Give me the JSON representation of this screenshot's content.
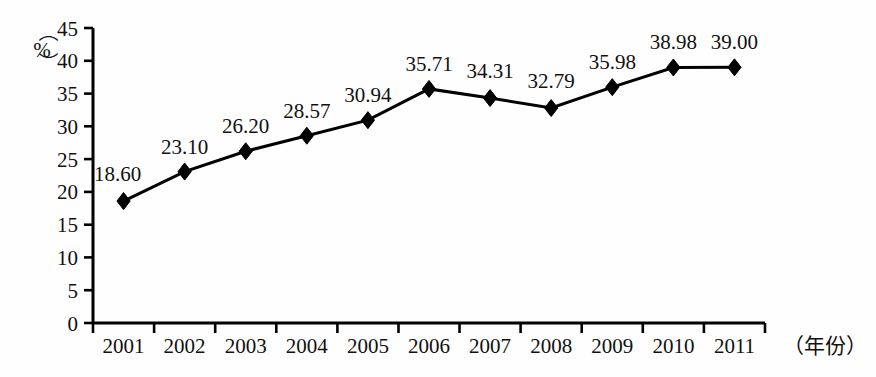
{
  "chart_data": {
    "type": "line",
    "title": "",
    "subtitle": "",
    "xlabel": "（年份）",
    "ylabel": "（%）",
    "ylabel_unit": "%",
    "categories": [
      "2001",
      "2002",
      "2003",
      "2004",
      "2005",
      "2006",
      "2007",
      "2008",
      "2009",
      "2010",
      "2011"
    ],
    "values": [
      18.6,
      23.1,
      26.2,
      28.57,
      30.94,
      35.71,
      34.31,
      32.79,
      35.98,
      38.98,
      39.0
    ],
    "data_labels": [
      "18.60",
      "23.10",
      "26.20",
      "28.57",
      "30.94",
      "35.71",
      "34.31",
      "32.79",
      "35.98",
      "38.98",
      "39.00"
    ],
    "ylim": [
      0,
      45
    ],
    "ytick_values": [
      0,
      5,
      10,
      15,
      20,
      25,
      30,
      35,
      40,
      45
    ],
    "ytick_labels": [
      "0",
      "5",
      "10",
      "15",
      "20",
      "25",
      "30",
      "35",
      "40",
      "45"
    ],
    "grid": false,
    "legend": null,
    "legend_position": "none",
    "marker": "diamond",
    "series_color": "#000000",
    "line_color": "#000000",
    "axis_color": "#000000",
    "background_color": "#ffffff",
    "series": [
      {
        "name": "",
        "values": [
          18.6,
          23.1,
          26.2,
          28.57,
          30.94,
          35.71,
          34.31,
          32.79,
          35.98,
          38.98,
          39.0
        ]
      }
    ]
  },
  "axis": {
    "y_unit_open_paren": "（",
    "y_unit_close_paren": "）",
    "y_unit_text": "%",
    "x_axis_caption": "（年份）"
  }
}
